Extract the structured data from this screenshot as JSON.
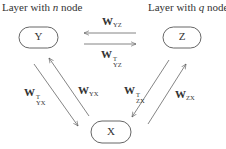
{
  "layers": {
    "left": {
      "prefix": "Layer with ",
      "var": "n",
      "suffix": " node"
    },
    "right": {
      "prefix": "Layer with ",
      "var": "q",
      "suffix": " node"
    }
  },
  "nodes": {
    "Y": {
      "label": "Y"
    },
    "Z": {
      "label": "Z"
    },
    "X": {
      "label": "X"
    }
  },
  "edges": [
    {
      "id": "W_YZ",
      "symbol": "W",
      "subscript": "YZ",
      "transpose": false,
      "direction": "Z→Y"
    },
    {
      "id": "W_YZ_T",
      "symbol": "W",
      "subscript": "YZ",
      "transpose": true,
      "sup": "T",
      "direction": "Y→Z"
    },
    {
      "id": "W_YX_T",
      "symbol": "W",
      "subscript": "YX",
      "transpose": true,
      "sup": "T",
      "direction": "Y→X"
    },
    {
      "id": "W_YX",
      "symbol": "W",
      "subscript": "YX",
      "transpose": false,
      "direction": "X→Y"
    },
    {
      "id": "W_ZX_T",
      "symbol": "W",
      "subscript": "ZX",
      "transpose": true,
      "sup": "T",
      "direction": "Z→X"
    },
    {
      "id": "W_ZX",
      "symbol": "W",
      "subscript": "ZX",
      "transpose": false,
      "direction": "X→Z"
    }
  ],
  "colors": {
    "stroke": "#555555",
    "text": "#333333"
  }
}
